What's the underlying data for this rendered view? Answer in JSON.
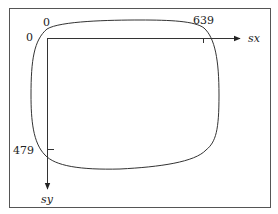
{
  "diagram": {
    "labels": {
      "origin_x": "0",
      "origin_y": "0",
      "x_max": "639",
      "y_max": "479",
      "x_axis": "sx",
      "y_axis": "sy"
    },
    "colors": {
      "line": "#333333",
      "frame": "#555555",
      "background": "#ffffff"
    }
  }
}
